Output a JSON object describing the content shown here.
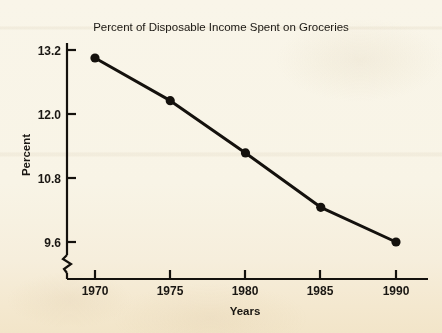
{
  "chart_data": {
    "type": "line",
    "title": "Percent of Disposable Income Spent on Groceries",
    "xlabel": "Years",
    "ylabel": "Percent",
    "x": [
      1970,
      1975,
      1980,
      1985,
      1990
    ],
    "categories": [
      "1970",
      "1975",
      "1980",
      "1985",
      "1990"
    ],
    "values": [
      13.05,
      12.25,
      11.27,
      10.25,
      9.6
    ],
    "series": [
      {
        "name": "Percent of Disposable Income Spent on Groceries",
        "values": [
          13.05,
          12.25,
          11.27,
          10.25,
          9.6
        ]
      }
    ],
    "xlim": [
      1968.2,
      1991.5
    ],
    "ylim": [
      9.25,
      13.45
    ],
    "ytick_labels": [
      "9.6",
      "10.8",
      "12.0",
      "13.2"
    ],
    "ytick_values": [
      9.6,
      10.8,
      12.0,
      13.2
    ],
    "xtick_labels": [
      "1970",
      "1975",
      "1980",
      "1985",
      "1990"
    ],
    "grid": false,
    "legend": false,
    "legend_position": "none",
    "y_axis_break": true,
    "marker": "filled-circle",
    "line_color": "#14110d",
    "marker_color": "#14110d",
    "background_color": "#f8f4e7",
    "text_color": "#1a1713"
  }
}
